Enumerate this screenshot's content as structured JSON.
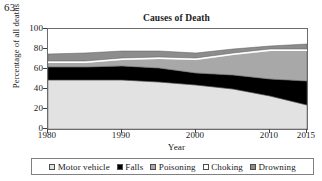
{
  "problem_number": "63.",
  "chart_data": {
    "type": "area",
    "title": "Causes of Death",
    "xlabel": "Year",
    "ylabel": "Percentage of all deaths",
    "xlim": [
      1980,
      2015
    ],
    "ylim": [
      0,
      100
    ],
    "xticks": [
      1980,
      1990,
      2000,
      2010,
      2015
    ],
    "xtick_labels": [
      "1980",
      "1990",
      "2000",
      "2010",
      "2015"
    ],
    "yticks": [
      0,
      20,
      40,
      60,
      80,
      100
    ],
    "ytick_labels": [
      "0",
      "20",
      "40",
      "60",
      "80",
      "100"
    ],
    "grid": false,
    "stacked": true,
    "legend_position": "bottom",
    "x": [
      1980,
      1985,
      1990,
      1995,
      2000,
      2005,
      2010,
      2015
    ],
    "series": [
      {
        "name": "Motor vehicle",
        "color": "#e2e2e2",
        "values": [
          49,
          49,
          49,
          47,
          44,
          40,
          33,
          24
        ]
      },
      {
        "name": "Falls",
        "color": "#000000",
        "values": [
          13,
          13,
          14,
          14,
          12,
          14,
          17,
          24
        ]
      },
      {
        "name": "Poisoning",
        "color": "#a8a8a8",
        "values": [
          4,
          4,
          6,
          9,
          13,
          20,
          28,
          30
        ]
      },
      {
        "name": "Choking",
        "color": "#ffffff",
        "values": [
          2,
          2,
          2,
          2,
          2,
          2,
          2,
          2
        ]
      },
      {
        "name": "Drowning",
        "color": "#8c8c8c",
        "values": [
          7,
          8,
          7,
          6,
          5,
          4,
          3,
          5
        ]
      }
    ]
  }
}
